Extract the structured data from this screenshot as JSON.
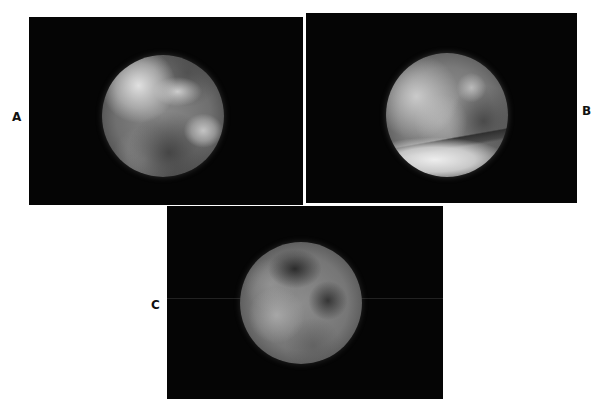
{
  "figure": {
    "panels": [
      {
        "id": "A",
        "label": "A",
        "content": "endoscopic circular view"
      },
      {
        "id": "B",
        "label": "B",
        "content": "endoscopic circular view"
      },
      {
        "id": "C",
        "label": "C",
        "content": "endoscopic circular view"
      }
    ],
    "colors": {
      "background": "#ffffff",
      "panel_background": "#050505",
      "label_color": "#111111"
    }
  }
}
